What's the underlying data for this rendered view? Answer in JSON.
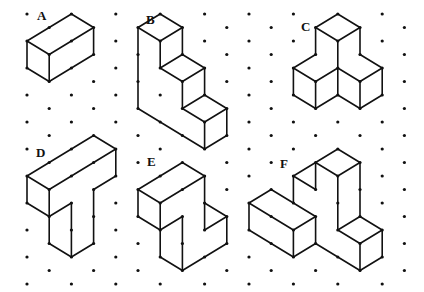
{
  "grid": {
    "origin_x": 27,
    "origin_y": 14,
    "col_step": 22.2,
    "row_step": 13.5,
    "cols": 18,
    "rows": 21,
    "dot_color": "#111111",
    "line_color": "#111111"
  },
  "shapes": [
    {
      "label": "A",
      "label_pos": [
        37,
        20
      ],
      "edges": [
        [
          [
            0,
            2
          ],
          [
            2,
            0
          ]
        ],
        [
          [
            2,
            0
          ],
          [
            3,
            1
          ]
        ],
        [
          [
            3,
            1
          ],
          [
            1,
            3
          ]
        ],
        [
          [
            1,
            3
          ],
          [
            0,
            2
          ]
        ],
        [
          [
            1,
            3
          ],
          [
            1,
            5
          ]
        ],
        [
          [
            0,
            2
          ],
          [
            0,
            4
          ]
        ],
        [
          [
            0,
            4
          ],
          [
            1,
            5
          ]
        ],
        [
          [
            1,
            5
          ],
          [
            3,
            3
          ]
        ],
        [
          [
            3,
            3
          ],
          [
            3,
            1
          ]
        ]
      ],
      "dots": [
        [
          1,
          1
        ],
        [
          2,
          2
        ],
        [
          2,
          4
        ]
      ]
    },
    {
      "label": "B",
      "label_pos": [
        146,
        24
      ],
      "edges": [
        [
          [
            5,
            1
          ],
          [
            6,
            0
          ]
        ],
        [
          [
            6,
            0
          ],
          [
            7,
            1
          ]
        ],
        [
          [
            7,
            1
          ],
          [
            6,
            2
          ]
        ],
        [
          [
            6,
            2
          ],
          [
            5,
            1
          ]
        ],
        [
          [
            6,
            2
          ],
          [
            6,
            4
          ]
        ],
        [
          [
            7,
            1
          ],
          [
            7,
            3
          ]
        ],
        [
          [
            6,
            4
          ],
          [
            7,
            3
          ]
        ],
        [
          [
            7,
            3
          ],
          [
            8,
            4
          ]
        ],
        [
          [
            8,
            4
          ],
          [
            7,
            5
          ]
        ],
        [
          [
            7,
            5
          ],
          [
            6,
            4
          ]
        ],
        [
          [
            7,
            5
          ],
          [
            7,
            7
          ]
        ],
        [
          [
            8,
            4
          ],
          [
            8,
            6
          ]
        ],
        [
          [
            7,
            7
          ],
          [
            8,
            6
          ]
        ],
        [
          [
            8,
            6
          ],
          [
            9,
            7
          ]
        ],
        [
          [
            9,
            7
          ],
          [
            8,
            8
          ]
        ],
        [
          [
            8,
            8
          ],
          [
            7,
            7
          ]
        ],
        [
          [
            8,
            8
          ],
          [
            8,
            10
          ]
        ],
        [
          [
            9,
            7
          ],
          [
            9,
            9
          ]
        ],
        [
          [
            9,
            9
          ],
          [
            8,
            10
          ]
        ],
        [
          [
            5,
            1
          ],
          [
            5,
            7
          ]
        ],
        [
          [
            5,
            7
          ],
          [
            8,
            10
          ]
        ]
      ],
      "dots": [
        [
          5,
          3
        ],
        [
          5,
          5
        ],
        [
          6,
          8
        ],
        [
          7,
          9
        ]
      ]
    },
    {
      "label": "C",
      "label_pos": [
        301,
        31
      ],
      "edges": [
        [
          [
            13,
            1
          ],
          [
            14,
            0
          ]
        ],
        [
          [
            14,
            0
          ],
          [
            15,
            1
          ]
        ],
        [
          [
            15,
            1
          ],
          [
            14,
            2
          ]
        ],
        [
          [
            14,
            2
          ],
          [
            13,
            1
          ]
        ],
        [
          [
            13,
            1
          ],
          [
            13,
            3
          ]
        ],
        [
          [
            15,
            1
          ],
          [
            15,
            3
          ]
        ],
        [
          [
            14,
            2
          ],
          [
            14,
            6
          ]
        ],
        [
          [
            13,
            3
          ],
          [
            12,
            4
          ]
        ],
        [
          [
            12,
            4
          ],
          [
            13,
            5
          ]
        ],
        [
          [
            13,
            5
          ],
          [
            14,
            4
          ]
        ],
        [
          [
            15,
            3
          ],
          [
            16,
            4
          ]
        ],
        [
          [
            16,
            4
          ],
          [
            15,
            5
          ]
        ],
        [
          [
            15,
            5
          ],
          [
            14,
            4
          ]
        ],
        [
          [
            12,
            4
          ],
          [
            12,
            6
          ]
        ],
        [
          [
            12,
            6
          ],
          [
            13,
            7
          ]
        ],
        [
          [
            13,
            5
          ],
          [
            13,
            7
          ]
        ],
        [
          [
            13,
            7
          ],
          [
            14,
            6
          ]
        ],
        [
          [
            14,
            6
          ],
          [
            15,
            7
          ]
        ],
        [
          [
            15,
            5
          ],
          [
            15,
            7
          ]
        ],
        [
          [
            16,
            4
          ],
          [
            16,
            6
          ]
        ],
        [
          [
            16,
            6
          ],
          [
            15,
            7
          ]
        ]
      ],
      "dots": []
    },
    {
      "label": "D",
      "label_pos": [
        36,
        157
      ],
      "edges": [
        [
          [
            0,
            12
          ],
          [
            3,
            9
          ]
        ],
        [
          [
            3,
            9
          ],
          [
            4,
            10
          ]
        ],
        [
          [
            4,
            10
          ],
          [
            1,
            13
          ]
        ],
        [
          [
            1,
            13
          ],
          [
            0,
            12
          ]
        ],
        [
          [
            4,
            10
          ],
          [
            4,
            12
          ]
        ],
        [
          [
            4,
            12
          ],
          [
            3,
            13
          ]
        ],
        [
          [
            3,
            13
          ],
          [
            3,
            17
          ]
        ],
        [
          [
            3,
            17
          ],
          [
            2,
            18
          ]
        ],
        [
          [
            2,
            18
          ],
          [
            1,
            17
          ]
        ],
        [
          [
            1,
            17
          ],
          [
            1,
            15
          ]
        ],
        [
          [
            1,
            13
          ],
          [
            1,
            15
          ]
        ],
        [
          [
            1,
            15
          ],
          [
            2,
            14
          ]
        ],
        [
          [
            2,
            14
          ],
          [
            2,
            18
          ]
        ],
        [
          [
            0,
            12
          ],
          [
            0,
            14
          ]
        ],
        [
          [
            0,
            14
          ],
          [
            1,
            15
          ]
        ]
      ],
      "dots": [
        [
          1,
          11
        ],
        [
          2,
          10
        ],
        [
          2,
          12
        ],
        [
          3,
          11
        ],
        [
          3,
          15
        ],
        [
          2,
          16
        ]
      ]
    },
    {
      "label": "E",
      "label_pos": [
        147,
        166
      ],
      "edges": [
        [
          [
            5,
            13
          ],
          [
            7,
            11
          ]
        ],
        [
          [
            7,
            11
          ],
          [
            8,
            12
          ]
        ],
        [
          [
            8,
            12
          ],
          [
            6,
            14
          ]
        ],
        [
          [
            6,
            14
          ],
          [
            5,
            13
          ]
        ],
        [
          [
            5,
            13
          ],
          [
            5,
            15
          ]
        ],
        [
          [
            5,
            15
          ],
          [
            6,
            16
          ]
        ],
        [
          [
            6,
            14
          ],
          [
            6,
            18
          ]
        ],
        [
          [
            6,
            18
          ],
          [
            7,
            19
          ]
        ],
        [
          [
            7,
            19
          ],
          [
            9,
            17
          ]
        ],
        [
          [
            9,
            17
          ],
          [
            9,
            15
          ]
        ],
        [
          [
            9,
            15
          ],
          [
            8,
            14
          ]
        ],
        [
          [
            8,
            14
          ],
          [
            8,
            12
          ]
        ],
        [
          [
            8,
            14
          ],
          [
            8,
            16
          ]
        ],
        [
          [
            8,
            16
          ],
          [
            9,
            15
          ]
        ],
        [
          [
            6,
            16
          ],
          [
            7,
            15
          ]
        ],
        [
          [
            7,
            15
          ],
          [
            7,
            19
          ]
        ]
      ],
      "dots": [
        [
          6,
          12
        ],
        [
          7,
          13
        ],
        [
          7,
          17
        ],
        [
          8,
          18
        ]
      ]
    },
    {
      "label": "F",
      "label_pos": [
        280,
        168
      ],
      "edges": [
        [
          [
            13,
            11
          ],
          [
            14,
            10
          ]
        ],
        [
          [
            14,
            10
          ],
          [
            15,
            11
          ]
        ],
        [
          [
            15,
            11
          ],
          [
            14,
            12
          ]
        ],
        [
          [
            14,
            12
          ],
          [
            13,
            11
          ]
        ],
        [
          [
            12,
            12
          ],
          [
            13,
            11
          ]
        ],
        [
          [
            12,
            12
          ],
          [
            13,
            13
          ]
        ],
        [
          [
            13,
            11
          ],
          [
            13,
            13
          ]
        ],
        [
          [
            12,
            12
          ],
          [
            12,
            14
          ]
        ],
        [
          [
            14,
            12
          ],
          [
            14,
            16
          ]
        ],
        [
          [
            15,
            11
          ],
          [
            15,
            15
          ]
        ],
        [
          [
            14,
            16
          ],
          [
            15,
            15
          ]
        ],
        [
          [
            15,
            15
          ],
          [
            16,
            16
          ]
        ],
        [
          [
            16,
            16
          ],
          [
            15,
            17
          ]
        ],
        [
          [
            15,
            17
          ],
          [
            14,
            16
          ]
        ],
        [
          [
            15,
            17
          ],
          [
            15,
            19
          ]
        ],
        [
          [
            16,
            16
          ],
          [
            16,
            18
          ]
        ],
        [
          [
            16,
            18
          ],
          [
            15,
            19
          ]
        ],
        [
          [
            15,
            19
          ],
          [
            13,
            17
          ]
        ],
        [
          [
            13,
            17
          ],
          [
            13,
            15
          ]
        ],
        [
          [
            10,
            14
          ],
          [
            11,
            13
          ]
        ],
        [
          [
            11,
            13
          ],
          [
            13,
            15
          ]
        ],
        [
          [
            13,
            15
          ],
          [
            12,
            16
          ]
        ],
        [
          [
            12,
            16
          ],
          [
            10,
            14
          ]
        ],
        [
          [
            10,
            14
          ],
          [
            10,
            16
          ]
        ],
        [
          [
            10,
            16
          ],
          [
            12,
            18
          ]
        ],
        [
          [
            12,
            18
          ],
          [
            13,
            17
          ]
        ],
        [
          [
            12,
            16
          ],
          [
            12,
            18
          ]
        ]
      ],
      "dots": [
        [
          14,
          14
        ],
        [
          15,
          13
        ],
        [
          11,
          15
        ],
        [
          11,
          17
        ],
        [
          14,
          18
        ]
      ]
    }
  ]
}
